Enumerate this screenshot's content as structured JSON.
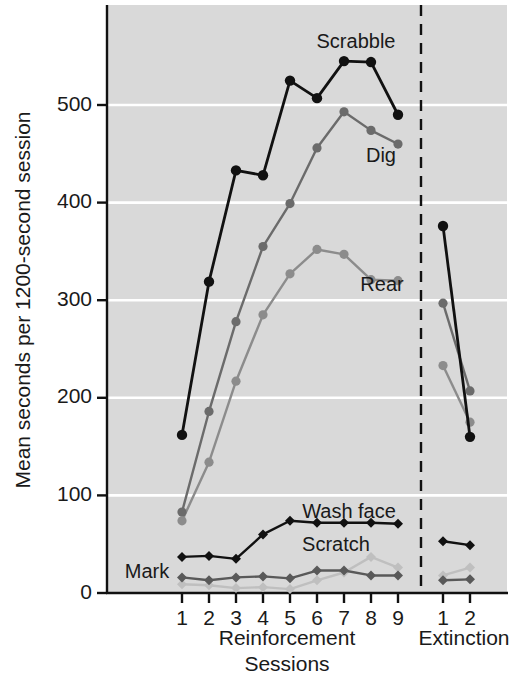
{
  "chart_data": {
    "type": "line",
    "title": "",
    "xlabel": "Sessions",
    "ylabel": "Mean seconds per 1200-second session",
    "ylim": [
      0,
      600
    ],
    "yticks": [
      0,
      100,
      200,
      300,
      400,
      500
    ],
    "grid": "horizontal",
    "legend_position": "inline-annotations",
    "plot_background": "#d9d9d9",
    "phases": [
      {
        "name": "Reinforcement",
        "sessions": [
          "1",
          "2",
          "3",
          "4",
          "5",
          "6",
          "7",
          "8",
          "9"
        ]
      },
      {
        "name": "Extinction",
        "sessions": [
          "1",
          "2"
        ]
      }
    ],
    "phase_divider": "dashed",
    "series": [
      {
        "name": "Scrabble",
        "color": "#111111",
        "marker": "circle",
        "label_x_session": 7,
        "reinforcement": [
          162,
          319,
          433,
          428,
          525,
          507,
          545,
          544,
          490
        ],
        "extinction": [
          376,
          160
        ]
      },
      {
        "name": "Dig",
        "color": "#6b6b6b",
        "marker": "circle",
        "label_x_session": 8,
        "reinforcement": [
          83,
          186,
          278,
          355,
          399,
          456,
          493,
          474,
          460
        ],
        "extinction": [
          297,
          207
        ]
      },
      {
        "name": "Rear",
        "color": "#8c8c8c",
        "marker": "circle",
        "label_x_session": 9,
        "reinforcement": [
          74,
          134,
          217,
          285,
          327,
          352,
          347,
          321,
          320
        ],
        "extinction": [
          233,
          175
        ]
      },
      {
        "name": "Wash face",
        "color": "#111111",
        "marker": "diamond",
        "label_x_session": 6,
        "reinforcement": [
          37,
          38,
          35,
          60,
          74,
          72,
          72,
          72,
          71
        ],
        "extinction": [
          53,
          49
        ]
      },
      {
        "name": "Scratch",
        "color": "#bfbfbf",
        "marker": "diamond",
        "label_x_session": 6,
        "reinforcement": [
          9,
          8,
          5,
          6,
          4,
          13,
          21,
          37,
          26
        ],
        "extinction": [
          18,
          26
        ]
      },
      {
        "name": "Mark",
        "color": "#595959",
        "marker": "diamond",
        "label_x_session": 1,
        "reinforcement": [
          16,
          13,
          16,
          17,
          15,
          23,
          23,
          18,
          18
        ],
        "extinction": [
          13,
          14
        ]
      }
    ],
    "annotations": [
      {
        "text": "Scrabble",
        "x": 356,
        "y": 48
      },
      {
        "text": "Dig",
        "x": 381,
        "y": 162
      },
      {
        "text": "Rear",
        "x": 382,
        "y": 291
      },
      {
        "text": "Wash face",
        "x": 349,
        "y": 518
      },
      {
        "text": "Scratch",
        "x": 336,
        "y": 551
      },
      {
        "text": "Mark",
        "x": 147,
        "y": 578
      }
    ]
  },
  "axes": {
    "y_tick_labels": [
      "500",
      "400",
      "300",
      "200",
      "100",
      "0"
    ],
    "x_tick_labels_reinforcement": [
      "1",
      "2",
      "3",
      "4",
      "5",
      "6",
      "7",
      "8",
      "9"
    ],
    "x_tick_labels_extinction": [
      "1",
      "2"
    ],
    "phase_label_reinforcement": "Reinforcement",
    "phase_label_extinction": "Extinction",
    "x_axis_title": "Sessions",
    "y_axis_title": "Mean seconds per 1200-second session"
  }
}
